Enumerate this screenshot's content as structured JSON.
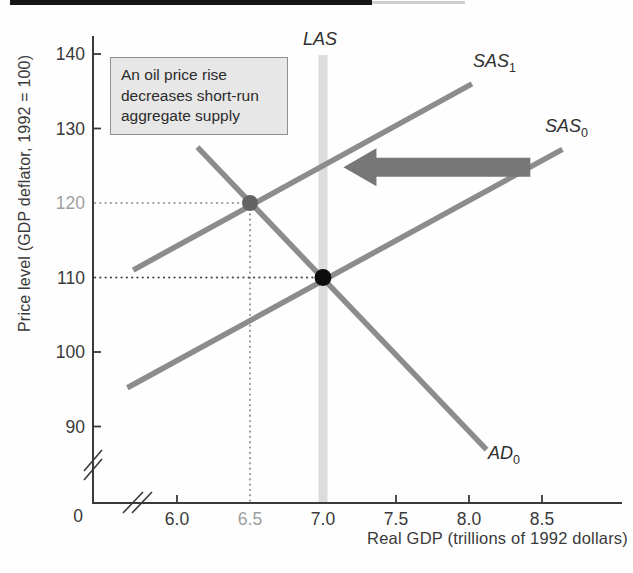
{
  "annotation_box": {
    "lines": [
      "An oil price rise",
      "decreases short-run",
      "aggregate supply"
    ]
  },
  "axes": {
    "origin_label": "0"
  },
  "curve_labels": {
    "las": {
      "text": "LAS",
      "sub": ""
    },
    "sas1": {
      "text": "SAS",
      "sub": "1"
    },
    "sas0": {
      "text": "SAS",
      "sub": "0"
    },
    "ad0": {
      "text": "AD",
      "sub": "0"
    }
  },
  "colors": {
    "axis": "#3a3a3a",
    "curve": "#8c8c8c",
    "band": "#dcdcdc",
    "arrow": "#777777",
    "muted_label": "#9e9e9e",
    "dark_label": "#3a3a3a",
    "gray_point": "#636363",
    "black_point": "#0d0d0d"
  },
  "chart_data": {
    "type": "line",
    "title": "An oil price rise decreases short-run aggregate supply",
    "xlabel": "Real GDP (trillions of 1992 dollars)",
    "ylabel": "Price level (GDP deflator, 1992 = 100)",
    "xlim": [
      5.5,
      8.8
    ],
    "ylim": [
      85,
      143
    ],
    "grid": false,
    "axis_breaks": {
      "x": true,
      "y": true
    },
    "x_ticks": [
      {
        "value": 6.0,
        "label": "6.0",
        "color": "#3a3a3a",
        "tick": true
      },
      {
        "value": 6.5,
        "label": "6.5",
        "color": "#9e9e9e",
        "tick": false
      },
      {
        "value": 7.0,
        "label": "7.0",
        "color": "#3a3a3a",
        "tick": false
      },
      {
        "value": 7.5,
        "label": "7.5",
        "color": "#3a3a3a",
        "tick": true
      },
      {
        "value": 8.0,
        "label": "8.0",
        "color": "#3a3a3a",
        "tick": true
      },
      {
        "value": 8.5,
        "label": "8.5",
        "color": "#3a3a3a",
        "tick": true
      }
    ],
    "y_ticks": [
      {
        "value": 140,
        "label": "140",
        "color": "#3a3a3a",
        "tick": true
      },
      {
        "value": 130,
        "label": "130",
        "color": "#3a3a3a",
        "tick": true
      },
      {
        "value": 120,
        "label": "120",
        "color": "#9e9e9e",
        "tick": false
      },
      {
        "value": 110,
        "label": "110",
        "color": "#3a3a3a",
        "tick": false
      },
      {
        "value": 100,
        "label": "100",
        "color": "#3a3a3a",
        "tick": true
      },
      {
        "value": 90,
        "label": "90",
        "color": "#3a3a3a",
        "tick": true
      }
    ],
    "series": [
      {
        "name": "LAS",
        "type": "vertical-band",
        "x": 7.0,
        "top": 140,
        "color": "#dcdcdc"
      },
      {
        "name": "SAS1",
        "type": "line",
        "points": [
          [
            5.7,
            111.0
          ],
          [
            8.02,
            136.0
          ]
        ],
        "color": "#8c8c8c"
      },
      {
        "name": "SAS0",
        "type": "line",
        "points": [
          [
            5.66,
            95.2
          ],
          [
            8.64,
            127.2
          ]
        ],
        "color": "#8c8c8c"
      },
      {
        "name": "AD0",
        "type": "line",
        "points": [
          [
            6.14,
            127.5
          ],
          [
            8.12,
            86.9
          ]
        ],
        "color": "#8c8c8c"
      }
    ],
    "points": [
      {
        "name": "new-equilibrium-point",
        "x": 6.5,
        "y": 120,
        "r": 8,
        "color": "#636363",
        "dotted_to_y_axis": true,
        "dotted_to_x_axis": true,
        "dotted_color": "#9a9a9a"
      },
      {
        "name": "initial-equilibrium-point",
        "x": 7.0,
        "y": 110,
        "r": 8.5,
        "color": "#0d0d0d",
        "dotted_to_y_axis": true,
        "dotted_to_x_axis": false,
        "dotted_color": "#4a4a4a"
      }
    ],
    "shift_arrow": {
      "direction": "left",
      "from_x": 8.42,
      "to_x": 7.14,
      "y": 124.8,
      "color": "#777777"
    }
  }
}
